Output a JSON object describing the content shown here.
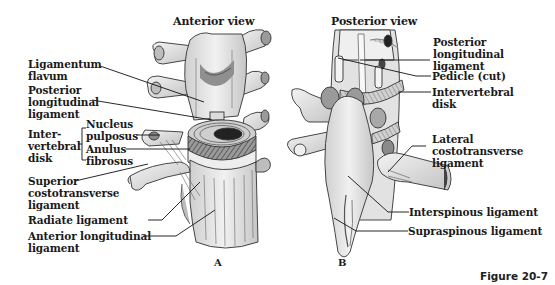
{
  "figure": {
    "caption": "Figure 20-7"
  },
  "panel_a": {
    "title": "Anterior view",
    "letter": "A",
    "labels": {
      "ligamentum_flavum": "Ligamentum\nflavum",
      "posterior_longitudinal_ligament": "Posterior\nlongitudinal\nligament",
      "intervertebral_disk": "Inter-\nvertebral\ndisk",
      "nucleus_pulposus": "Nucleus\npulposus",
      "anulus_fibrosus": "Anulus\nfibrosus",
      "superior_costotransverse_ligament": "Superior\ncostotransverse\nligament",
      "radiate_ligament": "Radiate ligament",
      "anterior_longitudinal_ligament": "Anterior longitudinal\nligament"
    }
  },
  "panel_b": {
    "title": "Posterior view",
    "letter": "B",
    "labels": {
      "posterior_longitudinal_ligament": "Posterior\nlongitudinal\nligament",
      "pedicle_cut": "Pedicle (cut)",
      "intervertebral_disk": "Intervertebral\ndisk",
      "lateral_costotransverse_ligament": "Lateral\ncostotransverse\nligament",
      "interspinous_ligament": "Interspinous ligament",
      "supraspinous_ligament": "Supraspinous ligament"
    }
  },
  "colors": {
    "bone": "#e9e9e9",
    "bone_shadow": "#b9b9b9",
    "dark": "#555555",
    "line": "#111111"
  }
}
